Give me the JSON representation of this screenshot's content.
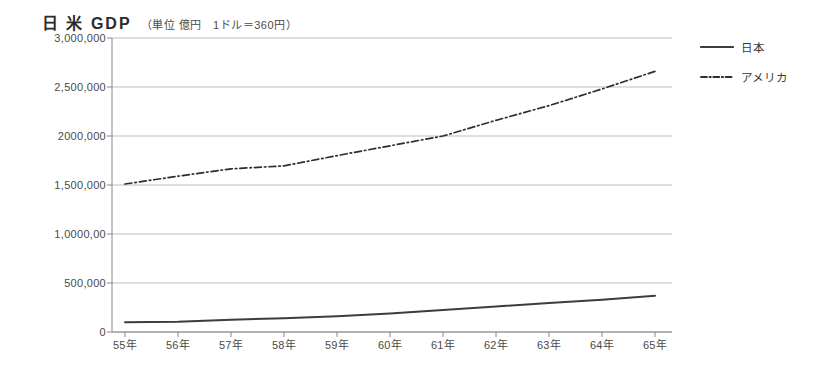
{
  "chart_data": {
    "type": "line",
    "title": "日 米 GDP",
    "subtitle": "（単位 億円　1ドル＝360円）",
    "xlabel": "",
    "ylabel": "",
    "grid": true,
    "legend_position": "right",
    "categories": [
      "55年",
      "56年",
      "57年",
      "58年",
      "59年",
      "60年",
      "61年",
      "62年",
      "63年",
      "64年",
      "65年"
    ],
    "x_tick_labels": [
      "55年",
      "56年",
      "57年",
      "58年",
      "59年",
      "60年",
      "61年",
      "62年",
      "63年",
      "64年",
      "65年"
    ],
    "y_tick_labels": [
      "3,000,000",
      "2,500,000",
      "2000,000",
      "1,500,000",
      "1,0000,00",
      "500,000",
      "0"
    ],
    "y_tick_values": [
      3000000,
      2500000,
      2000000,
      1500000,
      1000000,
      500000,
      0
    ],
    "ylim": [
      0,
      3000000
    ],
    "series": [
      {
        "name": "日本",
        "style": "solid",
        "color": "#3c3c3c",
        "values": [
          100000,
          105000,
          125000,
          140000,
          160000,
          190000,
          225000,
          260000,
          295000,
          330000,
          370000
        ]
      },
      {
        "name": "アメリカ",
        "style": "dash-dot",
        "color": "#2e2e2e",
        "values": [
          1510000,
          1590000,
          1665000,
          1695000,
          1800000,
          1900000,
          2000000,
          2160000,
          2310000,
          2480000,
          2660000
        ]
      }
    ]
  },
  "legend": {
    "items": [
      {
        "label": "日本",
        "style": "solid"
      },
      {
        "label": "アメリカ",
        "style": "dash-dot"
      }
    ]
  }
}
